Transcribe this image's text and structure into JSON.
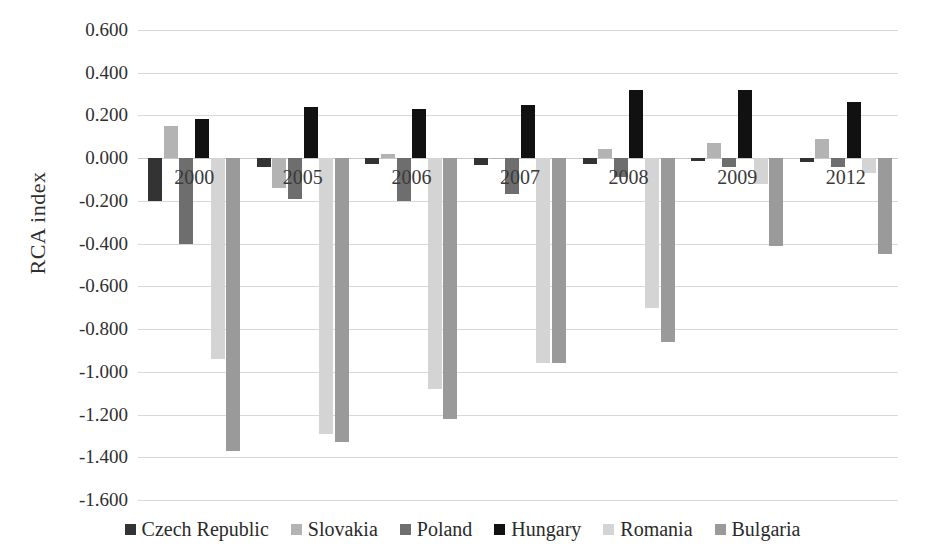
{
  "chart_data": {
    "type": "bar",
    "title": "",
    "xlabel": "",
    "ylabel": "RCA index",
    "ylim": [
      -1.6,
      0.6
    ],
    "ytick_step": 0.2,
    "grid": true,
    "legend_position": "bottom",
    "categories": [
      "2000",
      "2005",
      "2006",
      "2007",
      "2008",
      "2009",
      "2012"
    ],
    "ytick_labels": [
      "0.600",
      "0.400",
      "0.200",
      "0.000",
      "-0.200",
      "-0.400",
      "-0.600",
      "-0.800",
      "-1.000",
      "-1.200",
      "-1.400",
      "-1.600"
    ],
    "ytick_values": [
      0.6,
      0.4,
      0.2,
      0.0,
      -0.2,
      -0.4,
      -0.6,
      -0.8,
      -1.0,
      -1.2,
      -1.4,
      -1.6
    ],
    "series": [
      {
        "name": "Czech Republic",
        "color": "#333333",
        "values": [
          -0.2,
          -0.04,
          -0.025,
          -0.03,
          -0.025,
          -0.015,
          -0.02
        ]
      },
      {
        "name": "Slovakia",
        "color": "#b3b3b3",
        "values": [
          0.15,
          -0.14,
          0.02,
          0.0,
          0.045,
          0.07,
          0.09
        ]
      },
      {
        "name": "Poland",
        "color": "#6e6e6e",
        "values": [
          -0.4,
          -0.19,
          -0.2,
          -0.17,
          -0.09,
          -0.04,
          -0.04
        ]
      },
      {
        "name": "Hungary",
        "color": "#111111",
        "values": [
          0.185,
          0.24,
          0.23,
          0.25,
          0.32,
          0.32,
          0.265
        ]
      },
      {
        "name": "Romania",
        "color": "#d4d4d4",
        "values": [
          -0.94,
          -1.29,
          -1.08,
          -0.96,
          -0.7,
          -0.12,
          -0.07
        ]
      },
      {
        "name": "Bulgaria",
        "color": "#9a9a9a",
        "values": [
          -1.37,
          -1.33,
          -1.22,
          -0.96,
          -0.86,
          -0.41,
          -0.45
        ]
      }
    ]
  },
  "legend": {
    "items": [
      {
        "label": "Czech Republic",
        "color": "#333333"
      },
      {
        "label": "Slovakia",
        "color": "#b3b3b3"
      },
      {
        "label": "Poland",
        "color": "#6e6e6e"
      },
      {
        "label": "Hungary",
        "color": "#111111"
      },
      {
        "label": "Romania",
        "color": "#d4d4d4"
      },
      {
        "label": "Bulgaria",
        "color": "#9a9a9a"
      }
    ]
  }
}
